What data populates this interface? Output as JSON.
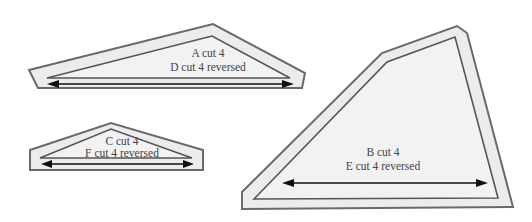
{
  "diagram": {
    "title": "",
    "colors": {
      "background": "#ffffff",
      "seam_allowance_fill": "#ececec",
      "piece_fill": "#f2f2f2",
      "outline": "#6a6a6a",
      "grainline": "#111111",
      "label_text": "#444444"
    },
    "pieces": [
      {
        "id": "A-D",
        "line1": "A cut 4",
        "line2": "D cut 4 reversed",
        "grainline": "horizontal double arrow"
      },
      {
        "id": "C-F",
        "line1": "C cut 4",
        "line2": "F cut 4 reversed",
        "grainline": "horizontal double arrow"
      },
      {
        "id": "B-E",
        "line1": "B cut 4",
        "line2": "E cut 4 reversed",
        "grainline": "horizontal double arrow"
      }
    ]
  }
}
